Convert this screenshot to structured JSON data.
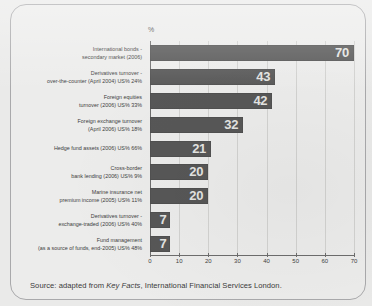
{
  "figure": {
    "axis_title": "%",
    "source_prefix": "Source: adapted from ",
    "source_italic": "Key Facts",
    "source_suffix": ", International Financial Services London.",
    "bar_color": "#575757",
    "value_label_color": "#e4e4e2",
    "panel_color": "#ececeb",
    "frame_color": "#a9a9ab"
  },
  "chart_data": {
    "type": "bar",
    "orientation": "horizontal",
    "title": "",
    "subtitle": "",
    "xlabel": "%",
    "ylabel": "",
    "xlim": [
      0,
      70
    ],
    "xticks": [
      0,
      10,
      20,
      30,
      40,
      50,
      60,
      70
    ],
    "grid": true,
    "legend": false,
    "categories": [
      "International bonds -\nsecondary market (2006)",
      "Derivatives turnover -\nover-the-counter (April 2004) US% 24%",
      "Foreign equities\nturnover (2006) US% 33%",
      "Foreign exchange turnover\n(April 2006) US% 18%",
      "Hedge fund assets (2006) US% 66%",
      "Cross-border\nbank lending (2006) US% 9%",
      "Marine insurance net\npremium income (2005) US% 11%",
      "Derivatives turnover -\nexchange-traded (2006) US% 40%",
      "Fund management\n(as a source of funds, end-2005) US% 48%"
    ],
    "category_lines": [
      [
        "International bonds -",
        "secondary market (2006)"
      ],
      [
        "Derivatives turnover -",
        "over-the-counter (April 2004) US% 24%"
      ],
      [
        "Foreign equities",
        "turnover (2006) US% 33%"
      ],
      [
        "Foreign exchange turnover",
        "(April 2006) US% 18%"
      ],
      [
        "Hedge fund assets (2006) US% 66%"
      ],
      [
        "Cross-border",
        "bank lending (2006) US% 9%"
      ],
      [
        "Marine insurance net",
        "premium income (2005) US% 11%"
      ],
      [
        "Derivatives turnover -",
        "exchange-traded (2006) US% 40%"
      ],
      [
        "Fund management",
        "(as a source of funds, end-2005) US% 48%"
      ]
    ],
    "values": [
      70,
      43,
      42,
      32,
      21,
      20,
      20,
      7,
      7
    ],
    "value_labels": [
      "70",
      "43",
      "42",
      "32",
      "21",
      "20",
      "20",
      "7",
      "7"
    ]
  }
}
